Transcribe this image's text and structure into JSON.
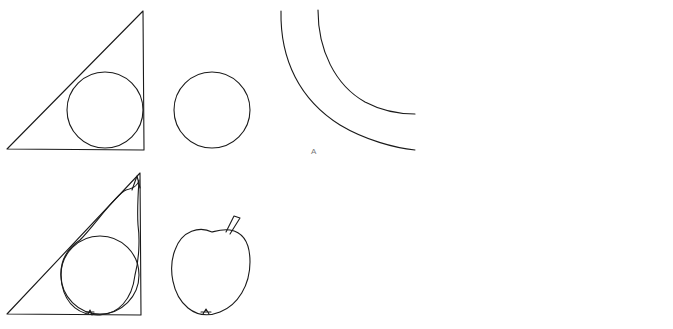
{
  "figure": {
    "panels": [
      {
        "id": "triangle-circles",
        "row": "top",
        "shapes": [
          "right triangle with inscribed circle",
          "circle"
        ]
      },
      {
        "id": "pear-apple",
        "row": "bottom",
        "shapes": [
          "pear inside triangle",
          "apple"
        ]
      },
      {
        "id": "arcs",
        "row": "top",
        "shapes": [
          "two concentric arcs"
        ],
        "label": "A"
      },
      {
        "id": "banana",
        "row": "bottom",
        "shapes": [
          "banana"
        ]
      },
      {
        "id": "circles-triangle",
        "row": "top",
        "shapes": [
          "two small circles",
          "circle",
          "triangle"
        ]
      },
      {
        "id": "cherries-grapes-peach",
        "row": "bottom",
        "shapes": [
          "cherries",
          "peach",
          "bunch of grapes"
        ]
      }
    ],
    "arc_label": "A",
    "caption_cropped": ""
  }
}
